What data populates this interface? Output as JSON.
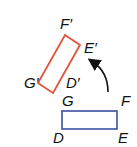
{
  "diagram": {
    "type": "rotation",
    "image": {
      "label": "image",
      "color": "#e2533a",
      "vertices": [
        {
          "name": "F'",
          "x": 65,
          "y": 35
        },
        {
          "name": "E'",
          "x": 80,
          "y": 45
        },
        {
          "name": "D'",
          "x": 53,
          "y": 93
        },
        {
          "name": "G'",
          "x": 38,
          "y": 83
        }
      ]
    },
    "preimage": {
      "label": "preimage",
      "color": "#3b4fa0",
      "vertices": [
        {
          "name": "G",
          "x": 62,
          "y": 111
        },
        {
          "name": "F",
          "x": 117,
          "y": 111
        },
        {
          "name": "E",
          "x": 117,
          "y": 129
        },
        {
          "name": "D",
          "x": 62,
          "y": 129
        }
      ]
    },
    "labels": {
      "F_prime": "F′",
      "E_prime": "E′",
      "G_prime": "G′",
      "D_prime": "D′",
      "G": "G",
      "F": "F",
      "D": "D",
      "E": "E"
    },
    "arrow": {
      "direction": "counterclockwise",
      "color": "#111111"
    }
  }
}
